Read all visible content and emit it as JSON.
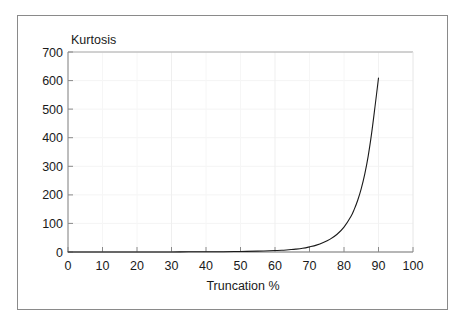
{
  "figure": {
    "background_color": "#ffffff",
    "frame_color": "#8a8a8a"
  },
  "chart_data": {
    "type": "line",
    "title": "",
    "subtitle": "",
    "xlabel": "Truncation %",
    "ylabel": "Kurtosis",
    "ylabel_position": "top-left-inside",
    "xlim": [
      0,
      100
    ],
    "ylim": [
      0,
      700
    ],
    "xticks": [
      0,
      10,
      20,
      30,
      40,
      50,
      60,
      70,
      80,
      90,
      100
    ],
    "xtick_labels": [
      "0",
      "10",
      "20",
      "30",
      "40",
      "50",
      "60",
      "70",
      "80",
      "90",
      "100"
    ],
    "yticks": [
      0,
      100,
      200,
      300,
      400,
      500,
      600,
      700
    ],
    "ytick_labels": [
      "0",
      "100",
      "200",
      "300",
      "400",
      "500",
      "600",
      "700"
    ],
    "grid": true,
    "grid_color": "#f2f2f2",
    "legend": false,
    "legend_position": "none",
    "axis_color": "#8a8a8a",
    "line_color": "#1a1a1a",
    "line_width": 1.1,
    "series": [
      {
        "name": "Kurtosis",
        "x": [
          0,
          5,
          10,
          15,
          20,
          25,
          30,
          35,
          40,
          45,
          50,
          55,
          60,
          62,
          64,
          66,
          68,
          70,
          72,
          74,
          76,
          78,
          80,
          82,
          83,
          84,
          85,
          86,
          87,
          88,
          89,
          90
        ],
        "values": [
          0,
          0,
          0,
          0,
          0,
          0,
          0,
          1,
          1,
          1,
          2,
          3,
          5,
          6,
          8,
          10,
          13,
          18,
          24,
          33,
          45,
          62,
          87,
          124,
          150,
          182,
          222,
          272,
          335,
          415,
          510,
          609
        ]
      }
    ]
  },
  "annotations": {
    "curve_end_x": 90,
    "curve_end_y": 609
  }
}
